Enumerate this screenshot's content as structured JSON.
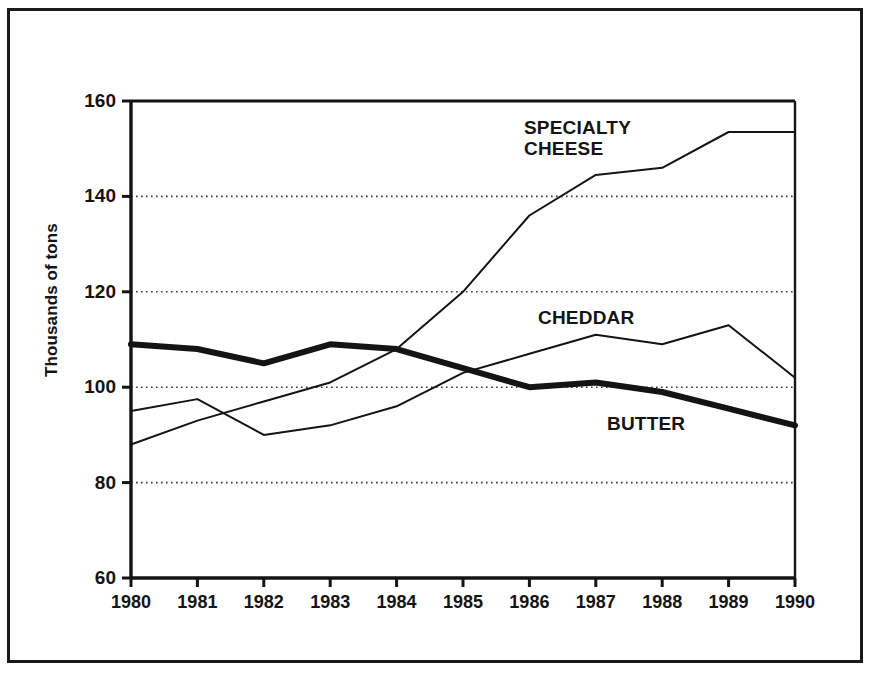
{
  "chart_data": {
    "type": "line",
    "title": "",
    "subtitle": "",
    "xlabel": "",
    "ylabel": "Thousands of tons",
    "categories": [
      "1980",
      "1981",
      "1982",
      "1983",
      "1984",
      "1985",
      "1986",
      "1987",
      "1988",
      "1989",
      "1990"
    ],
    "x": [
      1980,
      1981,
      1982,
      1983,
      1984,
      1985,
      1986,
      1987,
      1988,
      1989,
      1990
    ],
    "xlim": [
      1980,
      1990
    ],
    "ylim": [
      60,
      160
    ],
    "y_ticks": [
      60,
      80,
      100,
      120,
      140,
      160
    ],
    "x_ticks": [
      1980,
      1981,
      1982,
      1983,
      1984,
      1985,
      1986,
      1987,
      1988,
      1989,
      1990
    ],
    "grid": "horizontal-dotted",
    "gridlines_at": [
      80,
      100,
      120,
      140
    ],
    "legend": "inline-annotations",
    "series": [
      {
        "name": "SPECIALTY CHEESE",
        "label": "SPECIALTY\nCHEESE",
        "color": "#141414",
        "line_width": 2,
        "values": [
          88,
          93,
          97,
          101,
          108,
          120,
          136,
          144.5,
          146,
          153.5,
          153.5
        ]
      },
      {
        "name": "CHEDDAR",
        "label": "CHEDDAR",
        "color": "#141414",
        "line_width": 2,
        "values": [
          95,
          97.5,
          90,
          92,
          96,
          103,
          107,
          111,
          109,
          113,
          102
        ]
      },
      {
        "name": "BUTTER",
        "label": "BUTTER",
        "color": "#141414",
        "line_width": 6,
        "values": [
          109,
          108,
          105,
          109,
          108,
          104,
          100,
          101,
          99,
          95.5,
          92
        ]
      }
    ]
  },
  "axis": {
    "y_tick_labels": [
      "160",
      "140",
      "120",
      "100",
      "80",
      "60"
    ],
    "x_tick_labels": [
      "1980",
      "1981",
      "1982",
      "1983",
      "1984",
      "1985",
      "1986",
      "1987",
      "1988",
      "1989",
      "1990"
    ],
    "y_title": "Thousands of tons"
  },
  "annotations": {
    "specialty": "SPECIALTY\nCHEESE",
    "cheddar": "CHEDDAR",
    "butter": "BUTTER"
  },
  "colors": {
    "ink": "#141414",
    "background": "#ffffff",
    "grid": "#3a3a3a"
  }
}
